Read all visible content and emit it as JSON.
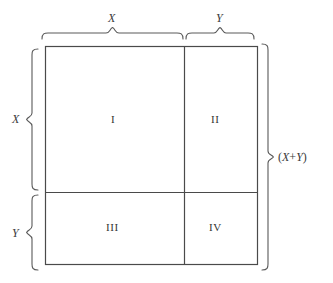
{
  "figure": {
    "type": "geometric-diagram",
    "top_braces": [
      {
        "label": "X",
        "span": "left-segment"
      },
      {
        "label": "Y",
        "span": "right-segment"
      }
    ],
    "left_braces": [
      {
        "label": "X",
        "span": "upper-segment"
      },
      {
        "label": "Y",
        "span": "lower-segment"
      }
    ],
    "right_brace": {
      "label": "(X + Y)",
      "span": "full-height"
    },
    "regions": [
      {
        "id": "I",
        "label": "I",
        "position": "top-left",
        "area": "X squared"
      },
      {
        "id": "II",
        "label": "II",
        "position": "top-right",
        "area": "X times Y"
      },
      {
        "id": "III",
        "label": "III",
        "position": "bottom-left",
        "area": "X times Y"
      },
      {
        "id": "IV",
        "label": "IV",
        "position": "bottom-right",
        "area": "Y squared"
      }
    ],
    "sum_parts": {
      "open_paren": "(",
      "first_term": "X",
      "operator": "+",
      "second_term": "Y",
      "close_paren": ")"
    },
    "colors": {
      "stroke": "#4a4a4a",
      "brace_stroke": "#5a5a5a",
      "text": "#3a3a3a",
      "background": "#ffffff"
    }
  }
}
